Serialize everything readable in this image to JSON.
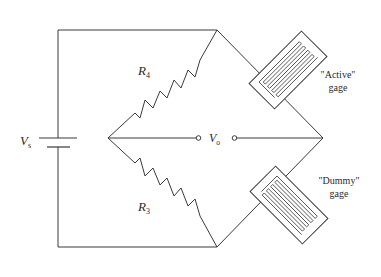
{
  "diagram": {
    "type": "Wheatstone bridge strain gage circuit",
    "supply": {
      "symbol": "V",
      "subscript": "s"
    },
    "output": {
      "symbol": "V",
      "subscript": "o"
    },
    "resistors": [
      {
        "id": "R4",
        "symbol": "R",
        "subscript": "4"
      },
      {
        "id": "R3",
        "symbol": "R",
        "subscript": "3"
      }
    ],
    "gages": [
      {
        "id": "active",
        "line1": "\"Active\"",
        "line2": "gage"
      },
      {
        "id": "dummy",
        "line1": "\"Dummy\"",
        "line2": "gage"
      }
    ],
    "colors": {
      "line": "#3a3a3a",
      "text": "#2a2a2a",
      "background": "#ffffff"
    }
  }
}
